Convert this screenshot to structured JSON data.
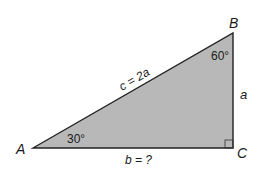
{
  "diagram": {
    "type": "right-triangle",
    "fill_color": "#b8b8b8",
    "stroke_color": "#222222",
    "vertices": {
      "A": {
        "label": "A"
      },
      "B": {
        "label": "B"
      },
      "C": {
        "label": "C"
      }
    },
    "angles": {
      "A": "30°",
      "B": "60°",
      "C": "right-angle"
    },
    "sides": {
      "hypotenuse": "c = 2a",
      "vertical": "a",
      "base": "b = ?"
    }
  }
}
